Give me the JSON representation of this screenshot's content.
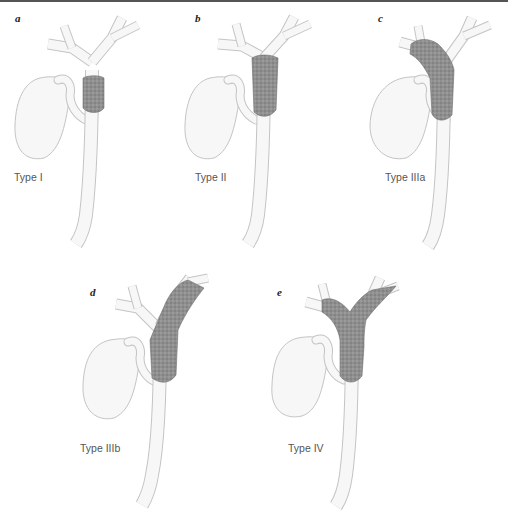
{
  "figure": {
    "colors": {
      "duct_fill": "#f7f7f7",
      "duct_stroke": "#bdbdbd",
      "tumor_fill": "#8f8f8f",
      "tumor_stroke": "#6e6e6e",
      "label_text": "#555555",
      "panel_letter": "#222222"
    },
    "panels": [
      {
        "letter": "a",
        "type_label": "Type I"
      },
      {
        "letter": "b",
        "type_label": "Type II"
      },
      {
        "letter": "c",
        "type_label": "Type IIIa"
      },
      {
        "letter": "d",
        "type_label": "Type IIIb"
      },
      {
        "letter": "e",
        "type_label": "Type IV"
      }
    ]
  }
}
